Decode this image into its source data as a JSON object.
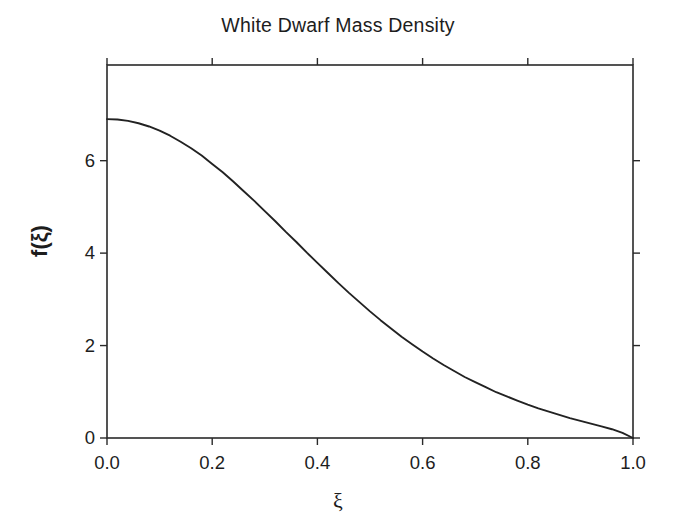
{
  "chart_data": {
    "type": "line",
    "title": "White Dwarf Mass Density",
    "xlabel": "ξ",
    "ylabel": "f(ξ)",
    "xlim": [
      0.0,
      1.0
    ],
    "ylim": [
      0.0,
      8.07
    ],
    "grid": false,
    "legend": null,
    "xticks": [
      0.0,
      0.2,
      0.4,
      0.6,
      0.8,
      1.0
    ],
    "xtick_labels": [
      "0.0",
      "0.2",
      "0.4",
      "0.6",
      "0.8",
      "1.0"
    ],
    "yticks": [
      0,
      2,
      4,
      6
    ],
    "ytick_labels": [
      "0",
      "2",
      "4",
      "6"
    ],
    "series": [
      {
        "name": "f(ξ)",
        "color": "#222222",
        "x": [
          0.0,
          0.02,
          0.04,
          0.06,
          0.08,
          0.1,
          0.12,
          0.14,
          0.16,
          0.18,
          0.2,
          0.22,
          0.24,
          0.26,
          0.28,
          0.3,
          0.32,
          0.34,
          0.36,
          0.38,
          0.4,
          0.42,
          0.44,
          0.46,
          0.48,
          0.5,
          0.52,
          0.54,
          0.56,
          0.58,
          0.6,
          0.62,
          0.64,
          0.66,
          0.68,
          0.7,
          0.72,
          0.74,
          0.76,
          0.78,
          0.8,
          0.82,
          0.84,
          0.86,
          0.88,
          0.9,
          0.92,
          0.94,
          0.96,
          0.98,
          1.0
        ],
        "y": [
          6.9,
          6.89,
          6.86,
          6.81,
          6.74,
          6.65,
          6.54,
          6.41,
          6.27,
          6.11,
          5.93,
          5.75,
          5.55,
          5.34,
          5.13,
          4.91,
          4.69,
          4.46,
          4.24,
          4.01,
          3.79,
          3.57,
          3.35,
          3.14,
          2.94,
          2.74,
          2.55,
          2.37,
          2.19,
          2.03,
          1.87,
          1.72,
          1.58,
          1.45,
          1.32,
          1.21,
          1.1,
          0.99,
          0.9,
          0.81,
          0.72,
          0.64,
          0.57,
          0.5,
          0.43,
          0.37,
          0.31,
          0.25,
          0.19,
          0.11,
          0.0
        ]
      }
    ]
  },
  "axes": {
    "frame_color": "#2a2a2a",
    "tick_direction": "out"
  }
}
